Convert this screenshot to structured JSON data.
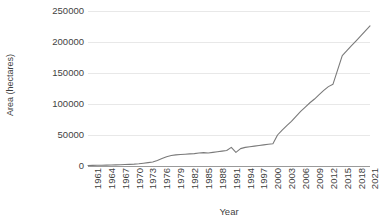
{
  "chart_data": {
    "type": "line",
    "title": "",
    "xlabel": "Year",
    "ylabel": "Area (hectares)",
    "xlim": [
      1961,
      2022
    ],
    "ylim": [
      0,
      250000
    ],
    "grid": true,
    "legend": false,
    "line_color": "#7a7a7a",
    "x_tick_labels": [
      "1961",
      "1964",
      "1967",
      "1970",
      "1973",
      "1976",
      "1979",
      "1982",
      "1985",
      "1988",
      "1991",
      "1994",
      "1997",
      "2000",
      "2003",
      "2006",
      "2009",
      "2012",
      "2015",
      "2018",
      "2021"
    ],
    "y_tick_labels": [
      "0",
      "50000",
      "100000",
      "150000",
      "200000",
      "250000"
    ],
    "y_tick_values": [
      0,
      50000,
      100000,
      150000,
      200000,
      250000
    ],
    "x": [
      1961,
      1962,
      1963,
      1964,
      1965,
      1966,
      1967,
      1968,
      1969,
      1970,
      1971,
      1972,
      1973,
      1974,
      1975,
      1976,
      1977,
      1978,
      1979,
      1980,
      1981,
      1982,
      1983,
      1984,
      1985,
      1986,
      1987,
      1988,
      1989,
      1990,
      1991,
      1992,
      1993,
      1994,
      1995,
      1996,
      1997,
      1998,
      1999,
      2000,
      2001,
      2002,
      2003,
      2004,
      2005,
      2006,
      2007,
      2008,
      2009,
      2010,
      2011,
      2012,
      2013,
      2014,
      2015,
      2016,
      2017,
      2018,
      2019,
      2020,
      2021,
      2022
    ],
    "values": [
      900,
      1000,
      1100,
      1200,
      1400,
      1600,
      1800,
      2000,
      2300,
      2600,
      3000,
      3600,
      4500,
      5500,
      6500,
      9000,
      12000,
      15000,
      17000,
      18000,
      18500,
      19000,
      19500,
      20000,
      21000,
      21500,
      21000,
      22000,
      23000,
      24000,
      25000,
      30000,
      22000,
      28000,
      30000,
      31000,
      32000,
      33000,
      34000,
      35000,
      36000,
      50000,
      58000,
      65000,
      72000,
      80000,
      88000,
      95000,
      102000,
      108000,
      115000,
      122000,
      128000,
      132000,
      155000,
      178000,
      186000,
      194000,
      202000,
      210000,
      218000,
      226000
    ],
    "series_name": "Area (hectares)"
  }
}
